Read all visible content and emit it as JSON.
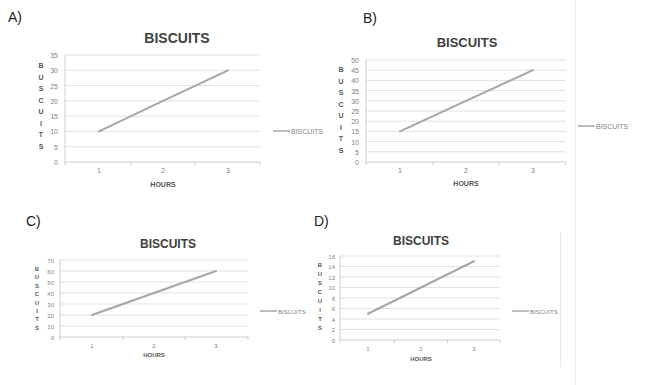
{
  "panels": [
    {
      "label": "A)"
    },
    {
      "label": "B)"
    },
    {
      "label": "C)"
    },
    {
      "label": "D)"
    }
  ],
  "colors": {
    "line": "#a6a6a6",
    "gridline": "#d9d9d9",
    "axis_text": "#7f7f7f",
    "title": "#404040"
  },
  "chart_data": [
    {
      "panel": "A)",
      "type": "line",
      "title": "BISCUITS",
      "xlabel": "HOURS",
      "ylabel": "BUSCUITS",
      "categories": [
        "1",
        "2",
        "3"
      ],
      "series": [
        {
          "name": "BISCUITS",
          "values": [
            10,
            20,
            30
          ]
        }
      ],
      "ylim": [
        0,
        35
      ],
      "yticks": [
        0,
        5,
        10,
        15,
        20,
        25,
        30,
        35
      ],
      "grid": true,
      "legend_position": "right"
    },
    {
      "panel": "B)",
      "type": "line",
      "title": "BISCUITS",
      "xlabel": "HOURS",
      "ylabel": "BUSCUITS",
      "categories": [
        "1",
        "2",
        "3"
      ],
      "series": [
        {
          "name": "BISCUITS",
          "values": [
            15,
            30,
            45
          ]
        }
      ],
      "ylim": [
        0,
        50
      ],
      "yticks": [
        0,
        5,
        10,
        15,
        20,
        25,
        30,
        35,
        40,
        45,
        50
      ],
      "grid": true,
      "legend_position": "right"
    },
    {
      "panel": "C)",
      "type": "line",
      "title": "BISCUITS",
      "xlabel": "HOURS",
      "ylabel": "BUSCUITS",
      "categories": [
        "1",
        "2",
        "3"
      ],
      "series": [
        {
          "name": "BISCUITS",
          "values": [
            20,
            40,
            60
          ]
        }
      ],
      "ylim": [
        0,
        70
      ],
      "yticks": [
        0,
        10,
        20,
        30,
        40,
        50,
        60,
        70
      ],
      "grid": true,
      "legend_position": "right"
    },
    {
      "panel": "D)",
      "type": "line",
      "title": "BISCUITS",
      "xlabel": "HOURS",
      "ylabel": "BUSCUITS",
      "categories": [
        "1",
        "2",
        "3"
      ],
      "series": [
        {
          "name": "BISCUITS",
          "values": [
            5,
            10,
            15
          ]
        }
      ],
      "ylim": [
        0,
        16
      ],
      "yticks": [
        0,
        2,
        4,
        6,
        8,
        10,
        12,
        14,
        16
      ],
      "grid": true,
      "legend_position": "right"
    }
  ]
}
